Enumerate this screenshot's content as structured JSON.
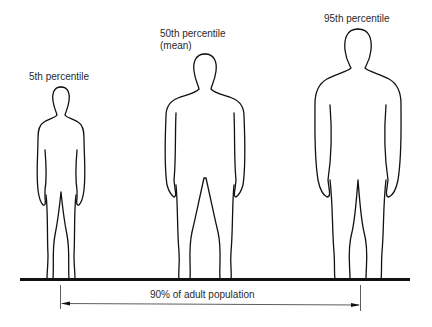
{
  "figures": [
    {
      "label": "5th percentile",
      "sublabel": ""
    },
    {
      "label": "50th percentile",
      "sublabel": "(mean)"
    },
    {
      "label": "95th percentile",
      "sublabel": ""
    }
  ],
  "dimension": {
    "label": "90% of adult population"
  },
  "colors": {
    "line": "#111111",
    "text": "#2a2a2a",
    "background": "#ffffff"
  }
}
